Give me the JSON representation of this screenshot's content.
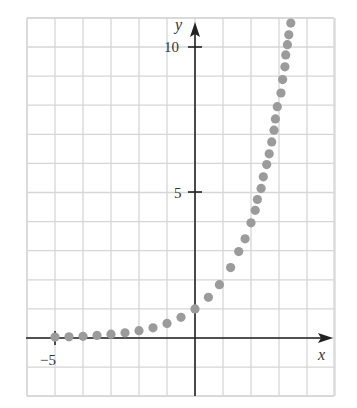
{
  "chart_data": {
    "type": "scatter",
    "title": "",
    "xlabel": "x",
    "ylabel": "y",
    "xlim": [
      -5.9,
      4.9
    ],
    "ylim": [
      -2.0,
      11.0
    ],
    "grid": true,
    "x_ticks_labeled": [
      {
        "value": -5,
        "label": "−5"
      }
    ],
    "y_ticks_labeled": [
      {
        "value": 5,
        "label": "5"
      },
      {
        "value": 10,
        "label": "10"
      }
    ],
    "series": [
      {
        "name": "y = 2^x",
        "color": "#9b9b9b",
        "points": [
          [
            -5.0,
            0.03
          ],
          [
            -4.5,
            0.04
          ],
          [
            -4.0,
            0.06
          ],
          [
            -3.5,
            0.09
          ],
          [
            -3.0,
            0.13
          ],
          [
            -2.5,
            0.18
          ],
          [
            -2.0,
            0.25
          ],
          [
            -1.5,
            0.35
          ],
          [
            -1.0,
            0.5
          ],
          [
            -0.5,
            0.71
          ],
          [
            0.0,
            1.0
          ],
          [
            0.48,
            1.4
          ],
          [
            0.87,
            1.83
          ],
          [
            1.27,
            2.42
          ],
          [
            1.56,
            2.97
          ],
          [
            1.79,
            3.41
          ],
          [
            2.0,
            3.96
          ],
          [
            2.15,
            4.39
          ],
          [
            2.23,
            4.76
          ],
          [
            2.36,
            5.14
          ],
          [
            2.44,
            5.54
          ],
          [
            2.56,
            5.96
          ],
          [
            2.65,
            6.33
          ],
          [
            2.74,
            6.74
          ],
          [
            2.82,
            7.14
          ],
          [
            2.87,
            7.53
          ],
          [
            2.94,
            7.95
          ],
          [
            3.07,
            8.42
          ],
          [
            3.13,
            8.88
          ],
          [
            3.21,
            9.32
          ],
          [
            3.24,
            9.73
          ],
          [
            3.3,
            10.08
          ],
          [
            3.35,
            10.42
          ],
          [
            3.42,
            10.82
          ]
        ]
      }
    ]
  },
  "labels": {
    "x_axis": "x",
    "y_axis": "y",
    "tick_neg5": "−5",
    "tick_5": "5",
    "tick_10": "10"
  }
}
